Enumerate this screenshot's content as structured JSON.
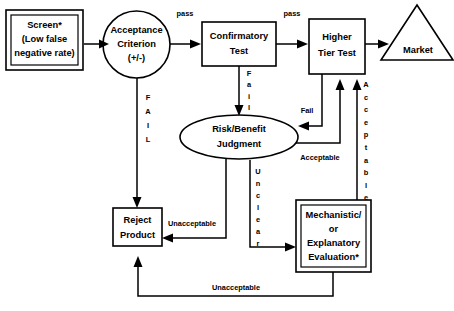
{
  "diagram": {
    "background_color": "#ffffff",
    "line_color": "#000000",
    "nodes": {
      "screen": {
        "shape": "double-rectangle",
        "lines": [
          "Screen*",
          "(Low false",
          "negative rate)"
        ]
      },
      "acceptance_criterion": {
        "shape": "ellipse",
        "lines": [
          "Acceptance",
          "Criterion",
          "(+/-)"
        ]
      },
      "confirmatory_test": {
        "shape": "rectangle",
        "lines": [
          "Confirmatory",
          "Test"
        ]
      },
      "higher_tier_test": {
        "shape": "rectangle",
        "lines": [
          "Higher",
          "Tier Test"
        ]
      },
      "market": {
        "shape": "triangle",
        "lines": [
          "Market"
        ]
      },
      "risk_benefit_judgment": {
        "shape": "ellipse",
        "lines": [
          "Risk/Benefit",
          "Judgment"
        ]
      },
      "reject_product": {
        "shape": "rectangle",
        "lines": [
          "Reject",
          "Product"
        ]
      },
      "mechanistic_evaluation": {
        "shape": "double-rectangle",
        "lines": [
          "Mechanistic/",
          "or",
          "Explanatory",
          "Evaluation*"
        ]
      }
    },
    "edge_labels": {
      "pass_1": "pass",
      "pass_2": "pass",
      "fail_vertical_left": "FAIL",
      "fail_vertical_confirmatory": "Fail",
      "fail_higher_tier": "Fail",
      "acceptable_horizontal": "Acceptable",
      "acceptable_vertical": "Acceptable",
      "unclear_vertical": "Unclear",
      "unacceptable_mid": "Unacceptable",
      "unacceptable_bottom": "Unacceptable"
    }
  }
}
